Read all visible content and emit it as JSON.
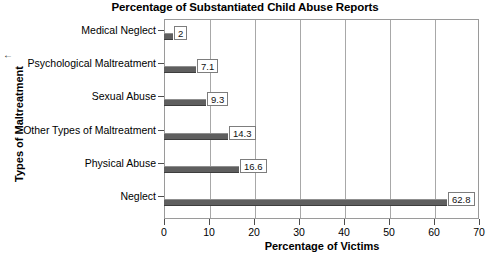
{
  "chart_data": {
    "type": "bar",
    "orientation": "horizontal",
    "title": "Percentage of Substantiated Child Abuse Reports",
    "xlabel": "Percentage of Victims",
    "ylabel": "Types of Maltreatment",
    "categories": [
      "Medical Neglect",
      "Psychological Maltreatment",
      "Sexual Abuse",
      "Other Types of Maltreatment",
      "Physical Abuse",
      "Neglect"
    ],
    "values": [
      2,
      7.1,
      9.3,
      14.3,
      16.6,
      62.8
    ],
    "value_labels": [
      "2",
      "7.1",
      "9.3",
      "14.3",
      "16.6",
      "62.8"
    ],
    "xlim": [
      0,
      70
    ],
    "xticks": [
      0,
      10,
      20,
      30,
      40,
      50,
      60,
      70
    ],
    "xtick_labels": [
      "0",
      "10",
      "20",
      "30",
      "40",
      "50",
      "60",
      "70"
    ],
    "grid": "vertical",
    "legend": "none",
    "bar_color": "#5f5f5f",
    "plot_border_color": "#9a9a9a",
    "gridline_color": "#a8a8a8",
    "background": "#ffffff"
  },
  "stray": {
    "mark": "←"
  }
}
